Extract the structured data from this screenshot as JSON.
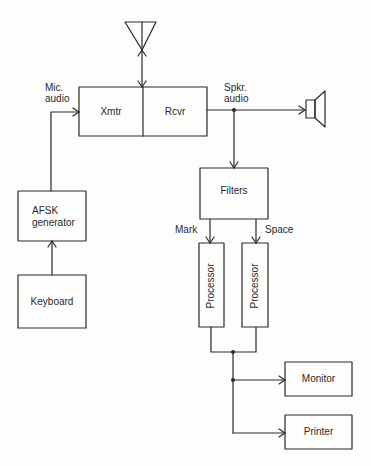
{
  "diagram": {
    "type": "block-diagram",
    "title": "",
    "blocks": {
      "xmtr": "Xmtr",
      "rcvr": "Rcvr",
      "filters": "Filters",
      "processor_mark": "Processor",
      "processor_space": "Processor",
      "afsk_line1": "AFSK",
      "afsk_line2": "generator",
      "keyboard": "Keyboard",
      "monitor": "Monitor",
      "printer": "Printer"
    },
    "labels": {
      "mic_line1": "Mic.",
      "mic_line2": "audio",
      "spkr_line1": "Spkr.",
      "spkr_line2": "audio",
      "mark": "Mark",
      "space": "Space"
    },
    "symbols": {
      "antenna": "antenna-icon",
      "speaker": "speaker-icon"
    },
    "connections": [
      {
        "from": "Antenna",
        "to": "Xmtr/Rcvr",
        "bidirectional": true
      },
      {
        "from": "Keyboard",
        "to": "AFSK generator"
      },
      {
        "from": "AFSK generator",
        "to": "Xmtr",
        "label": "Mic. audio"
      },
      {
        "from": "Rcvr",
        "to": "Speaker",
        "label": "Spkr. audio"
      },
      {
        "from": "Rcvr",
        "to": "Filters"
      },
      {
        "from": "Filters",
        "to": "Processor (Mark)",
        "label": "Mark"
      },
      {
        "from": "Filters",
        "to": "Processor (Space)",
        "label": "Space"
      },
      {
        "from": "Processors",
        "to": "Monitor"
      },
      {
        "from": "Processors",
        "to": "Printer"
      }
    ],
    "colors": {
      "line": "#2a2a2a",
      "background": "#fdfdfc"
    }
  }
}
